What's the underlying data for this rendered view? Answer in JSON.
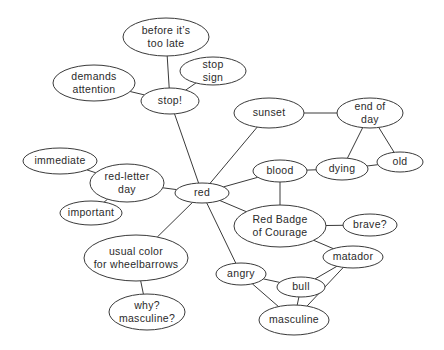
{
  "diagram": {
    "type": "concept-map",
    "center_node": "red",
    "colors": {
      "stroke": "#3a3a3a",
      "text": "#2a2a2a",
      "fill": "#ffffff",
      "background": "#ffffff"
    },
    "nodes": [
      {
        "id": "before-its-too-late",
        "lines": [
          "before it’s",
          "too late"
        ],
        "cx": 166,
        "cy": 37,
        "rx": 43,
        "ry": 19
      },
      {
        "id": "stop-sign",
        "lines": [
          "stop",
          "sign"
        ],
        "cx": 213,
        "cy": 71,
        "rx": 33,
        "ry": 14
      },
      {
        "id": "demands-attention",
        "lines": [
          "demands",
          "attention"
        ],
        "cx": 94,
        "cy": 83,
        "rx": 41,
        "ry": 18
      },
      {
        "id": "stop",
        "lines": [
          "stop!"
        ],
        "cx": 170,
        "cy": 101,
        "rx": 29,
        "ry": 13
      },
      {
        "id": "sunset",
        "lines": [
          "sunset"
        ],
        "cx": 269,
        "cy": 113,
        "rx": 35,
        "ry": 15
      },
      {
        "id": "end-of-day",
        "lines": [
          "end of",
          "day"
        ],
        "cx": 370,
        "cy": 113,
        "rx": 33,
        "ry": 15
      },
      {
        "id": "immediate",
        "lines": [
          "immediate"
        ],
        "cx": 60,
        "cy": 161,
        "rx": 37,
        "ry": 13
      },
      {
        "id": "old",
        "lines": [
          "old"
        ],
        "cx": 400,
        "cy": 162,
        "rx": 23,
        "ry": 10
      },
      {
        "id": "dying",
        "lines": [
          "dying"
        ],
        "cx": 342,
        "cy": 169,
        "rx": 26,
        "ry": 11
      },
      {
        "id": "blood",
        "lines": [
          "blood"
        ],
        "cx": 280,
        "cy": 171,
        "rx": 27,
        "ry": 11
      },
      {
        "id": "red-letter-day",
        "lines": [
          "red-letter",
          "day"
        ],
        "cx": 127,
        "cy": 183,
        "rx": 37,
        "ry": 19
      },
      {
        "id": "red",
        "lines": [
          "red"
        ],
        "cx": 202,
        "cy": 193,
        "rx": 27,
        "ry": 10
      },
      {
        "id": "important",
        "lines": [
          "important"
        ],
        "cx": 91,
        "cy": 213,
        "rx": 31,
        "ry": 12
      },
      {
        "id": "red-badge-of-courage",
        "lines": [
          "Red Badge",
          "of Courage"
        ],
        "cx": 280,
        "cy": 226,
        "rx": 46,
        "ry": 21
      },
      {
        "id": "brave",
        "lines": [
          "brave?"
        ],
        "cx": 370,
        "cy": 225,
        "rx": 27,
        "ry": 11
      },
      {
        "id": "matador",
        "lines": [
          "matador"
        ],
        "cx": 353,
        "cy": 257,
        "rx": 30,
        "ry": 11
      },
      {
        "id": "usual-color-for-wheelbarrows",
        "lines": [
          "usual color",
          "for wheelbarrows"
        ],
        "cx": 136,
        "cy": 258,
        "rx": 52,
        "ry": 23
      },
      {
        "id": "angry",
        "lines": [
          "angry"
        ],
        "cx": 241,
        "cy": 274,
        "rx": 25,
        "ry": 11
      },
      {
        "id": "bull",
        "lines": [
          "bull"
        ],
        "cx": 301,
        "cy": 287,
        "rx": 24,
        "ry": 10
      },
      {
        "id": "why-masculine",
        "lines": [
          "why?",
          "masculine?"
        ],
        "cx": 147,
        "cy": 312,
        "rx": 38,
        "ry": 18
      },
      {
        "id": "masculine",
        "lines": [
          "masculine"
        ],
        "cx": 294,
        "cy": 320,
        "rx": 35,
        "ry": 15
      }
    ],
    "edges": [
      {
        "from": "before-its-too-late",
        "to": "stop"
      },
      {
        "from": "stop-sign",
        "to": "stop"
      },
      {
        "from": "demands-attention",
        "to": "stop"
      },
      {
        "from": "stop",
        "to": "red"
      },
      {
        "from": "sunset",
        "to": "red"
      },
      {
        "from": "sunset",
        "to": "end-of-day"
      },
      {
        "from": "end-of-day",
        "to": "dying"
      },
      {
        "from": "end-of-day",
        "to": "old"
      },
      {
        "from": "dying",
        "to": "old"
      },
      {
        "from": "blood",
        "to": "dying"
      },
      {
        "from": "blood",
        "to": "red"
      },
      {
        "from": "blood",
        "to": "red-badge-of-courage"
      },
      {
        "from": "immediate",
        "to": "red-letter-day"
      },
      {
        "from": "important",
        "to": "red-letter-day"
      },
      {
        "from": "red-letter-day",
        "to": "red"
      },
      {
        "from": "red",
        "to": "red-badge-of-courage"
      },
      {
        "from": "red",
        "to": "usual-color-for-wheelbarrows"
      },
      {
        "from": "red",
        "to": "angry"
      },
      {
        "from": "red-badge-of-courage",
        "to": "brave"
      },
      {
        "from": "red-badge-of-courage",
        "to": "matador"
      },
      {
        "from": "matador",
        "to": "bull"
      },
      {
        "from": "matador",
        "to": "masculine"
      },
      {
        "from": "angry",
        "to": "bull"
      },
      {
        "from": "angry",
        "to": "masculine"
      },
      {
        "from": "bull",
        "to": "masculine"
      },
      {
        "from": "usual-color-for-wheelbarrows",
        "to": "why-masculine"
      }
    ]
  }
}
